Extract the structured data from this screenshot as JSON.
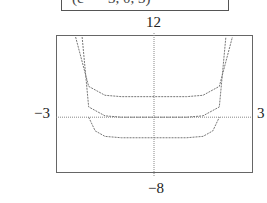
{
  "caption": "(c = −3, 0, 3)",
  "labels": {
    "ymax": "12",
    "ymin": "−8",
    "xmin": "−3",
    "xmax": "3"
  },
  "chart_data": {
    "type": "line",
    "title": "",
    "xlabel": "",
    "ylabel": "",
    "xlim": [
      -3,
      3
    ],
    "ylim": [
      -8,
      12
    ],
    "grid": false,
    "caption": "(c = −3, 0, 3)",
    "series": [
      {
        "name": "c = 3",
        "x": [
          -2.4,
          -2,
          -1.5,
          -1,
          0,
          1,
          1.5,
          2,
          2.4
        ],
        "values": [
          12,
          4.5,
          3.2,
          3,
          3,
          3,
          3.2,
          4.5,
          12
        ]
      },
      {
        "name": "c = 0",
        "x": [
          -2.2,
          -2,
          -1.5,
          -1,
          0,
          1,
          1.5,
          2,
          2.2
        ],
        "values": [
          12,
          1.5,
          0.2,
          0,
          0,
          0,
          0.2,
          1.5,
          12
        ]
      },
      {
        "name": "c = -3",
        "x": [
          -2,
          -1.8,
          -1.5,
          -1,
          0,
          1,
          1.5,
          1.8,
          2
        ],
        "values": [
          0,
          -2,
          -2.8,
          -3,
          -3,
          -3,
          -2.8,
          -2,
          0
        ]
      }
    ]
  }
}
